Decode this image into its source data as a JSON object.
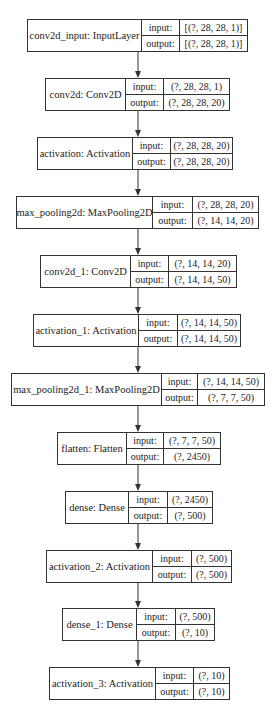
{
  "diagram": {
    "title": "",
    "type": "keras-model-plot",
    "input_key": "input:",
    "output_key": "output:",
    "layers": [
      {
        "name": "conv2d_input: InputLayer",
        "input": "[(?, 28, 28, 1)]",
        "output": "[(?, 28, 28, 1)]",
        "box": {
          "x": 27,
          "y": 19,
          "w": 221,
          "h": 33,
          "label_w": 114,
          "key_w": 38
        }
      },
      {
        "name": "conv2d: Conv2D",
        "input": "(?, 28, 28, 1)",
        "output": "(?, 28, 28, 20)",
        "box": {
          "x": 45,
          "y": 78,
          "w": 185,
          "h": 33,
          "label_w": 80,
          "key_w": 38
        }
      },
      {
        "name": "activation: Activation",
        "input": "(?, 28, 28, 20)",
        "output": "(?, 28, 28, 20)",
        "box": {
          "x": 37,
          "y": 137,
          "w": 196,
          "h": 33,
          "label_w": 95,
          "key_w": 38
        }
      },
      {
        "name": "max_pooling2d: MaxPooling2D",
        "input": "(?, 28, 28, 20)",
        "output": "(?, 14, 14, 20)",
        "box": {
          "x": 16,
          "y": 196,
          "w": 243,
          "h": 33,
          "label_w": 136,
          "key_w": 40
        }
      },
      {
        "name": "conv2d_1: Conv2D",
        "input": "(?, 14, 14, 20)",
        "output": "(?, 14, 14, 50)",
        "box": {
          "x": 40,
          "y": 255,
          "w": 197,
          "h": 33,
          "label_w": 90,
          "key_w": 38
        }
      },
      {
        "name": "activation_1: Activation",
        "input": "(?, 14, 14, 50)",
        "output": "(?, 14, 14, 50)",
        "box": {
          "x": 33,
          "y": 314,
          "w": 208,
          "h": 33,
          "label_w": 105,
          "key_w": 39
        }
      },
      {
        "name": "max_pooling2d_1: MaxPooling2D",
        "input": "(?, 14, 14, 50)",
        "output": "(?, 7, 7, 50)",
        "box": {
          "x": 11,
          "y": 373,
          "w": 254,
          "h": 33,
          "label_w": 150,
          "key_w": 36
        }
      },
      {
        "name": "flatten: Flatten",
        "input": "(?, 7, 7, 50)",
        "output": "(?, 2450)",
        "box": {
          "x": 57,
          "y": 432,
          "w": 164,
          "h": 33,
          "label_w": 69,
          "key_w": 37
        }
      },
      {
        "name": "dense: Dense",
        "input": "(?, 2450)",
        "output": "(?, 500)",
        "box": {
          "x": 65,
          "y": 491,
          "w": 148,
          "h": 33,
          "label_w": 63,
          "key_w": 39
        }
      },
      {
        "name": "activation_2: Activation",
        "input": "(?, 500)",
        "output": "(?, 500)",
        "box": {
          "x": 46,
          "y": 550,
          "w": 186,
          "h": 33,
          "label_w": 106,
          "key_w": 39
        }
      },
      {
        "name": "dense_1: Dense",
        "input": "(?, 500)",
        "output": "(?, 10)",
        "box": {
          "x": 62,
          "y": 608,
          "w": 153,
          "h": 33,
          "label_w": 74,
          "key_w": 39
        }
      },
      {
        "name": "activation_3: Activation",
        "input": "(?, 10)",
        "output": "(?, 10)",
        "box": {
          "x": 49,
          "y": 667,
          "w": 181,
          "h": 33,
          "label_w": 106,
          "key_w": 38
        }
      }
    ],
    "edge_x": 138,
    "colors": {
      "line": "#333333",
      "background": "#ffffff",
      "text": "#222222"
    }
  }
}
